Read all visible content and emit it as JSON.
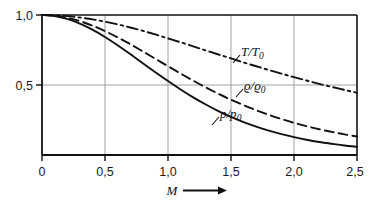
{
  "chart_data": {
    "type": "line",
    "title": "",
    "subtitle": "",
    "xlabel": "M",
    "ylabel": "",
    "xlim": [
      0,
      2.5
    ],
    "ylim": [
      0,
      1.0
    ],
    "grid": true,
    "legend_position": "inline-annotations",
    "x_ticks": [
      {
        "value": 0,
        "label": "0"
      },
      {
        "value": 0.5,
        "label": "0,5"
      },
      {
        "value": 1.0,
        "label": "1,0"
      },
      {
        "value": 1.5,
        "label": "1,5"
      },
      {
        "value": 2.0,
        "label": "2,0"
      },
      {
        "value": 2.5,
        "label": "2,5"
      }
    ],
    "y_ticks": [
      {
        "value": 0.5,
        "label": "0,5"
      },
      {
        "value": 1.0,
        "label": "1,0"
      }
    ],
    "x": [
      0,
      0.1,
      0.2,
      0.3,
      0.4,
      0.5,
      0.6,
      0.7,
      0.8,
      0.9,
      1.0,
      1.1,
      1.2,
      1.3,
      1.4,
      1.5,
      1.6,
      1.7,
      1.8,
      1.9,
      2.0,
      2.1,
      2.2,
      2.3,
      2.4,
      2.5
    ],
    "series": [
      {
        "name": "T/T0",
        "label": "T/T",
        "label_sub": "0",
        "style": "dash-dot",
        "color": "#111111",
        "values": [
          1.0,
          0.998,
          0.992,
          0.982,
          0.969,
          0.952,
          0.933,
          0.911,
          0.887,
          0.861,
          0.833,
          0.805,
          0.776,
          0.747,
          0.718,
          0.69,
          0.661,
          0.634,
          0.607,
          0.581,
          0.556,
          0.532,
          0.508,
          0.486,
          0.465,
          0.444
        ]
      },
      {
        "name": "rho/rho0",
        "label": "ϱ/ϱ",
        "label_sub": "0",
        "style": "dashed",
        "color": "#111111",
        "values": [
          1.0,
          0.995,
          0.98,
          0.956,
          0.924,
          0.885,
          0.84,
          0.792,
          0.74,
          0.687,
          0.634,
          0.582,
          0.531,
          0.483,
          0.437,
          0.395,
          0.356,
          0.32,
          0.287,
          0.257,
          0.23,
          0.206,
          0.184,
          0.165,
          0.147,
          0.132
        ]
      },
      {
        "name": "p/p0",
        "label": "p/p",
        "label_sub": "0",
        "style": "solid",
        "color": "#111111",
        "values": [
          1.0,
          0.993,
          0.972,
          0.939,
          0.896,
          0.843,
          0.784,
          0.721,
          0.656,
          0.591,
          0.528,
          0.468,
          0.412,
          0.361,
          0.314,
          0.272,
          0.235,
          0.203,
          0.174,
          0.149,
          0.128,
          0.109,
          0.093,
          0.08,
          0.068,
          0.059
        ]
      }
    ],
    "annotations": [
      {
        "name": "T/T0",
        "text": "T/T",
        "sub": "0",
        "x": 1.56,
        "y": 0.655
      },
      {
        "name": "rho/rho0",
        "text": "ϱ/ϱ",
        "sub": "0",
        "x": 1.5,
        "y": 0.445
      },
      {
        "name": "p/p0",
        "text": "p/p",
        "sub": "0",
        "x": 1.16,
        "y": 0.215
      }
    ]
  },
  "axis": {
    "x_title": "M",
    "x_arrow": "→"
  }
}
